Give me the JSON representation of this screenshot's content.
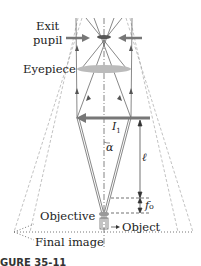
{
  "diagram": {
    "type": "compound-microscope-ray-diagram",
    "labels": {
      "exit_pupil_line1": "Exit",
      "exit_pupil_line2": "pupil",
      "eyepiece": "Eyepiece",
      "objective": "Objective",
      "object": "Object",
      "final_image": "Final image"
    },
    "symbols": {
      "intermediate_image": "I",
      "intermediate_image_sub": "1",
      "angle": "α",
      "length": "ℓ",
      "focal_length": "f",
      "focal_length_sub": "o"
    },
    "caption": "GURE 35-11",
    "colors": {
      "ray": "#555555",
      "lens": "#b8b8b8",
      "arrow": "#777777",
      "axis": "#666666"
    }
  }
}
